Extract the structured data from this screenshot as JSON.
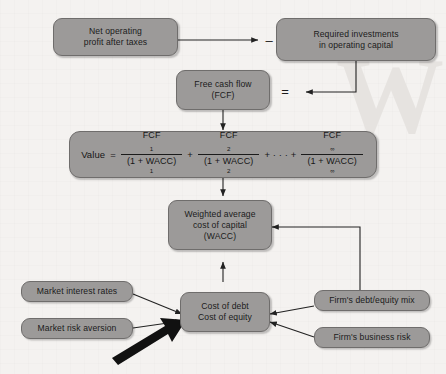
{
  "diagram": {
    "watermark_text": "W",
    "colors": {
      "background": "#f4f2f0",
      "node_fill": "#9c9a99",
      "node_border": "#6f6d6c",
      "text": "#1b1b1b",
      "connector": "#2b2b2b",
      "emphasis_arrow": "#101010"
    },
    "nodes": {
      "net_operating_profit": {
        "line1": "Net operating",
        "line2": "profit after taxes"
      },
      "required_investments": {
        "line1": "Required investments",
        "line2": "in operating capital"
      },
      "free_cash_flow": {
        "line1": "Free cash flow",
        "line2": "(FCF)"
      },
      "wacc": {
        "line1": "Weighted average",
        "line2": "cost of capital",
        "line3": "(WACC)"
      },
      "cost_of_capital_components": {
        "line1": "Cost of debt",
        "line2": "Cost of equity"
      },
      "market_interest_rates": {
        "label": "Market interest rates"
      },
      "market_risk_aversion": {
        "label": "Market risk aversion"
      },
      "firms_debt_equity_mix": {
        "label": "Firm's debt/equity mix"
      },
      "firms_business_risk": {
        "label": "Firm's business risk"
      }
    },
    "operators": {
      "minus": "–",
      "equals": "="
    },
    "formula": {
      "value_label": "Value",
      "equals": "=",
      "terms": [
        {
          "numerator": "FCF",
          "num_sub": "1",
          "denominator": "(1 + WACC)",
          "den_sup": "1"
        },
        {
          "numerator": "FCF",
          "num_sub": "2",
          "denominator": "(1 + WACC)",
          "den_sup": "2"
        },
        {
          "numerator": "FCF",
          "num_sub": "∞",
          "denominator": "(1 + WACC)",
          "den_sup": "∞"
        }
      ],
      "plus": "+",
      "ellipsis": "+ · · · +"
    }
  }
}
